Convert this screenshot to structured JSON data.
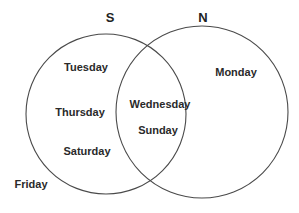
{
  "diagram": {
    "type": "venn",
    "sets": [
      {
        "id": "S",
        "label": "S"
      },
      {
        "id": "N",
        "label": "N"
      }
    ],
    "regions": {
      "S_only": [
        "Tuesday",
        "Thursday",
        "Saturday"
      ],
      "N_only": [
        "Monday"
      ],
      "S_and_N": [
        "Wednesday",
        "Sunday"
      ],
      "outside": [
        "Friday"
      ]
    },
    "colors": {
      "stroke": "#4a4a4a",
      "text": "#2a2a2a"
    }
  }
}
